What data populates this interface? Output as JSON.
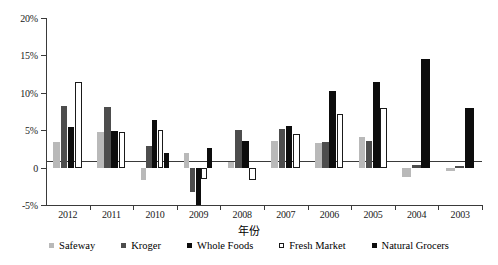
{
  "chart_data": {
    "type": "bar",
    "title": "",
    "xlabel": "年份",
    "ylabel": "",
    "ylim": [
      -5,
      20
    ],
    "grid": false,
    "legend_position": "bottom",
    "categories": [
      "2012",
      "2011",
      "2010",
      "2009",
      "2008",
      "2007",
      "2006",
      "2005",
      "2004",
      "2003"
    ],
    "ytick_labels": [
      "20%",
      "15%",
      "10%",
      "5%",
      "0",
      "-5%"
    ],
    "ytick_values": [
      20,
      15,
      10,
      5,
      0,
      -5
    ],
    "series": [
      {
        "name": "Safeway",
        "color": "#b9b9b9",
        "values": [
          3.4,
          4.7,
          -1.6,
          1.9,
          0.8,
          3.5,
          3.3,
          4.1,
          -1.3,
          -0.5
        ]
      },
      {
        "name": "Kroger",
        "color": "#4d4d4d",
        "values": [
          8.2,
          8.1,
          2.9,
          -3.2,
          5.0,
          5.1,
          3.4,
          3.5,
          0.4,
          0.2
        ]
      },
      {
        "name": "Whole Foods",
        "color": "#0d0d0d",
        "values": [
          5.4,
          4.9,
          6.4,
          -5.0,
          3.6,
          5.5,
          10.3,
          11.5,
          14.5,
          8.0
        ]
      },
      {
        "name": "Fresh Market",
        "color": "#ffffff",
        "values": [
          11.5,
          4.7,
          5.0,
          -1.5,
          -1.7,
          4.5,
          7.1,
          8.0,
          0.0,
          0.0
        ]
      },
      {
        "name": "Natural Grocers",
        "color": "#0d0d0d",
        "values": [
          0.0,
          0.0,
          1.9,
          2.6,
          0.0,
          0.0,
          0.0,
          0.0,
          0.0,
          0.0
        ]
      }
    ]
  },
  "axis": {
    "x_title": "年份"
  }
}
